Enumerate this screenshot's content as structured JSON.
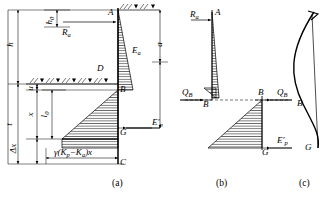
{
  "figure": {
    "stroke_color": "#000000",
    "hatch_color": "#000000",
    "background": "#ffffff"
  },
  "captions": [
    {
      "id": "caption-a",
      "text": "(a)",
      "x": 112,
      "y": 180
    },
    {
      "id": "caption-b",
      "text": "(b)",
      "x": 216,
      "y": 180
    },
    {
      "id": "caption-c",
      "text": "(c)",
      "x": 300,
      "y": 180
    }
  ],
  "panel_a": {
    "name": "pressure-distribution-diagram",
    "dimension_labels": [
      {
        "id": "dim-h",
        "text": "h",
        "x": 12,
        "y": 38,
        "rotated": true
      },
      {
        "id": "dim-h0",
        "text": "h",
        "sub": "0",
        "x": 51,
        "y": 18,
        "rotated": true
      },
      {
        "id": "dim-a",
        "text": "a",
        "x": 161,
        "y": 40,
        "rotated": true
      },
      {
        "id": "dim-t",
        "text": "t",
        "x": 12,
        "y": 120,
        "rotated": true
      },
      {
        "id": "dim-u",
        "text": "u",
        "x": 31,
        "y": 95,
        "rotated": true
      },
      {
        "id": "dim-x",
        "text": "x",
        "x": 31,
        "y": 122,
        "rotated": true
      },
      {
        "id": "dim-l0",
        "text": "l",
        "sub": "0",
        "x": 46,
        "y": 118,
        "rotated": true
      },
      {
        "id": "dim-delta-x",
        "text": "Δx",
        "x": 14,
        "y": 143,
        "rotated": true
      }
    ],
    "point_labels": [
      {
        "id": "point-A",
        "text": "A",
        "x": 108,
        "y": 13
      },
      {
        "id": "point-D",
        "text": "D",
        "x": 98,
        "y": 68
      },
      {
        "id": "point-B",
        "text": "B",
        "x": 116,
        "y": 95
      },
      {
        "id": "point-G",
        "text": "G",
        "x": 118,
        "y": 128
      },
      {
        "id": "point-C",
        "text": "C",
        "x": 118,
        "y": 163
      }
    ],
    "force_labels": [
      {
        "id": "force-Ra",
        "text": "R",
        "sub": "a",
        "x": 63,
        "y": 28
      },
      {
        "id": "force-Ea",
        "text": "E",
        "sub": "a",
        "x": 131,
        "y": 48
      },
      {
        "id": "force-Ep",
        "text": "E′",
        "sub": "p",
        "x": 152,
        "y": 130
      }
    ],
    "formula": {
      "id": "pressure-formula",
      "text": "γ(K",
      "sub1": "p",
      "mid": "−K",
      "sub2": "a",
      "tail": ")x",
      "x": 54,
      "y": 150
    }
  },
  "panel_b": {
    "name": "shear-force-diagram",
    "point_labels": [
      {
        "id": "point-A-b",
        "text": "A",
        "x": 215,
        "y": 13
      },
      {
        "id": "point-B-b1",
        "text": "B",
        "x": 204,
        "y": 104
      },
      {
        "id": "point-B-b2",
        "text": "B",
        "x": 261,
        "y": 92
      },
      {
        "id": "point-G-b",
        "text": "G",
        "x": 262,
        "y": 143
      }
    ],
    "force_labels": [
      {
        "id": "force-Ra-b",
        "text": "R",
        "sub": "a",
        "x": 190,
        "y": 13
      },
      {
        "id": "force-QB-l",
        "text": "Q",
        "sub": "B",
        "x": 183,
        "y": 90
      },
      {
        "id": "force-QB-r",
        "text": "Q",
        "sub": "B",
        "x": 278,
        "y": 90
      },
      {
        "id": "force-Ep-b",
        "text": "E′",
        "sub": "p",
        "x": 278,
        "y": 139
      }
    ]
  },
  "panel_c": {
    "name": "bending-moment-diagram",
    "point_labels": [
      {
        "id": "point-B-c",
        "text": "B",
        "x": 298,
        "y": 103
      },
      {
        "id": "point-G-c",
        "text": "G",
        "x": 306,
        "y": 142
      }
    ]
  }
}
